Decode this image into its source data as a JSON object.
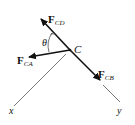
{
  "diagram": {
    "type": "free-body-diagram",
    "node": {
      "label": "C"
    },
    "forces": [
      {
        "id": "cd",
        "symbol": "F",
        "subscript": "CD",
        "direction": "up-left"
      },
      {
        "id": "ca",
        "symbol": "F",
        "subscript": "CA",
        "direction": "left"
      },
      {
        "id": "cb",
        "symbol": "F",
        "subscript": "CB",
        "direction": "down-right"
      }
    ],
    "angle": {
      "label": "θ",
      "between": [
        "F_CD",
        "F_CA"
      ]
    },
    "axes": [
      {
        "label": "x"
      },
      {
        "label": "y"
      }
    ]
  }
}
